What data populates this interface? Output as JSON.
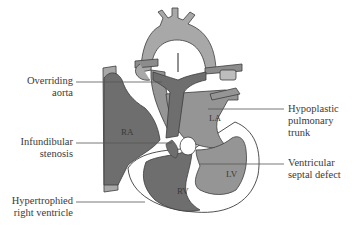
{
  "diagram": {
    "chambers": {
      "ra": "RA",
      "la": "LA",
      "rv": "RV",
      "lv": "LV"
    },
    "labels": {
      "overriding_aorta_1": "Overriding",
      "overriding_aorta_2": "aorta",
      "infundibular_1": "Infundibular",
      "infundibular_2": "stenosis",
      "hypertrophied_1": "Hypertrophied",
      "hypertrophied_2": "right ventricle",
      "hypoplastic_1": "Hypoplastic",
      "hypoplastic_2": "pulmonary",
      "hypoplastic_3": "trunk",
      "vsd_1": "Ventricular",
      "vsd_2": "septal defect"
    },
    "colors": {
      "dark_gray": "#6e6e6e",
      "mid_gray": "#8c8c8c",
      "light_gray": "#a8a8a8",
      "outline": "#3c3c3c",
      "wall": "#ffffff"
    }
  }
}
